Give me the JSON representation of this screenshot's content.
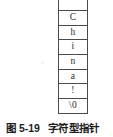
{
  "figure": {
    "caption_label": "图 5-19",
    "caption_title": "字符型指针",
    "caption_full": "图 5-19　字符型指针"
  },
  "memory_table": {
    "name": "character-string-memory-cells",
    "cells": [
      {
        "value": "",
        "note": "empty-partial-cell-at-top"
      },
      {
        "value": "C"
      },
      {
        "value": "h"
      },
      {
        "value": "i"
      },
      {
        "value": "n"
      },
      {
        "value": "a"
      },
      {
        "value": "!"
      },
      {
        "value": "\\0"
      }
    ],
    "string_contents": "China!\\0"
  },
  "colors": {
    "border": "#4a4a4a",
    "text": "#2b2b2b",
    "caption_text": "#1d1d1d",
    "background": "#ffffff"
  }
}
